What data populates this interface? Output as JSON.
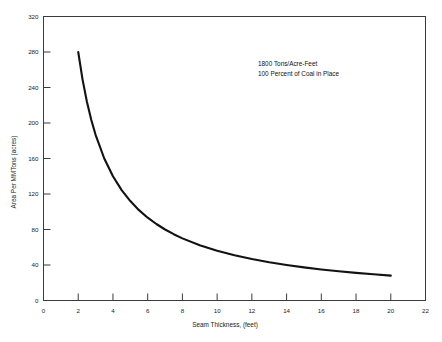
{
  "chart_data": {
    "type": "line",
    "title": "",
    "subtitle": "",
    "xlabel": "Seam Thickness, (feet)",
    "ylabel": "Area Per MMTons (acres)",
    "xlim": [
      0,
      22
    ],
    "ylim": [
      0,
      320
    ],
    "grid": false,
    "legend": null,
    "legend_position": "none",
    "xticks": [
      0,
      2,
      4,
      6,
      8,
      10,
      12,
      14,
      16,
      18,
      20,
      22
    ],
    "xtick_labels": [
      "0",
      "2",
      "4",
      "6",
      "8",
      "10",
      "12",
      "14",
      "16",
      "18",
      "20",
      "22"
    ],
    "yticks": [
      0,
      40,
      80,
      120,
      160,
      200,
      240,
      280,
      320
    ],
    "ytick_labels": [
      "0",
      "40",
      "80",
      "120",
      "160",
      "200",
      "240",
      "280",
      "320"
    ],
    "annotations": [
      "1800 Tons/Acre-Feet",
      "100 Percent of Coal in Place"
    ],
    "series": [
      {
        "name": "Area Per MMTons",
        "relation": "y = 560 / x",
        "x": [
          2.0,
          2.25,
          2.5,
          2.75,
          3.0,
          3.5,
          4.0,
          4.5,
          5.0,
          5.5,
          6.0,
          6.5,
          7.0,
          7.5,
          8.0,
          9.0,
          10.0,
          11.0,
          12.0,
          13.0,
          14.0,
          15.0,
          16.0,
          17.0,
          18.0,
          19.0,
          20.0
        ],
        "y": [
          280.0,
          248.9,
          224.0,
          203.6,
          186.7,
          160.0,
          140.0,
          124.4,
          112.0,
          101.8,
          93.3,
          86.2,
          80.0,
          74.7,
          70.0,
          62.2,
          56.0,
          50.9,
          46.7,
          43.1,
          40.0,
          37.3,
          35.0,
          32.9,
          31.1,
          29.5,
          28.0
        ]
      }
    ]
  },
  "colors": {
    "curve": "#121212",
    "frame": "#3b3b3b",
    "text": "#1a1a1a",
    "background": "#ffffff"
  }
}
